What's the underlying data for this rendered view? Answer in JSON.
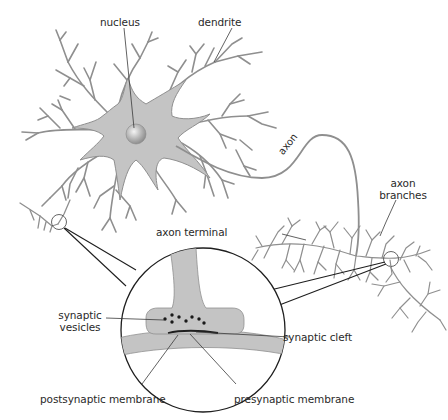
{
  "figure": {
    "type": "neuron-anatomy-diagram",
    "colors": {
      "cell_fill": "#c4c4c4",
      "cell_outline": "#8f8f8f",
      "outline_dark": "#1e1e1e",
      "label_text": "#2a2a2a",
      "background": "#ffffff"
    },
    "labels": {
      "nucleus": "nucleus",
      "dendrite": "dendrite",
      "axon": "axon",
      "axon_branches_line1": "axon",
      "axon_branches_line2": "branches",
      "axon_terminal": "axon terminal",
      "synaptic_vesicles_line1": "synaptic",
      "synaptic_vesicles_line2": "vesicles",
      "synaptic_cleft": "synaptic cleft",
      "postsynaptic_membrane": "postsynaptic membrane",
      "presynaptic_membrane": "presynaptic membrane"
    },
    "inset": {
      "description": "magnified view of synapse",
      "vesicle_count": 8
    }
  }
}
